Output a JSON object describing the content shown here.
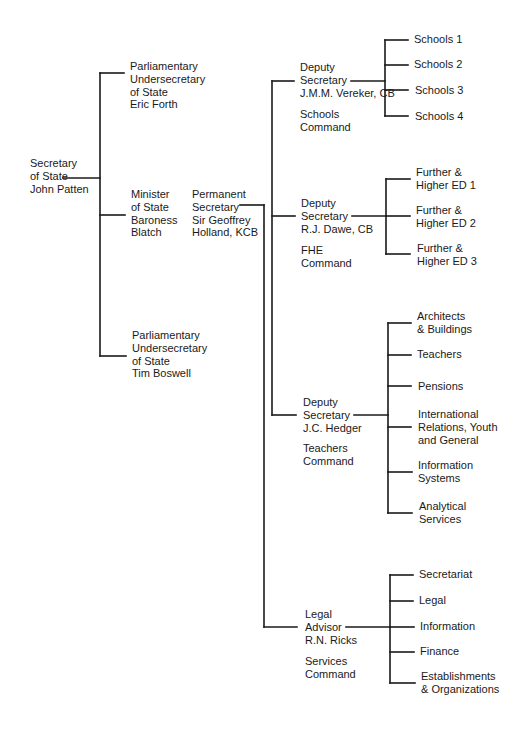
{
  "chart": {
    "type": "org-chart",
    "root": {
      "title_lines": [
        "Secretary",
        "of State",
        "John Patten"
      ]
    },
    "ministers": [
      {
        "title_lines": [
          "Parliamentary",
          "Undersecretary",
          "of State",
          "Eric Forth"
        ]
      },
      {
        "title_lines": [
          "Minister",
          "of State",
          "Baroness",
          "Blatch"
        ]
      },
      {
        "title_lines": [
          "Parliamentary",
          "Undersecretary",
          "of State",
          "Tim Boswell"
        ]
      }
    ],
    "permanent_secretary": {
      "title_lines": [
        "Permanent",
        "Secretary",
        "Sir Geoffrey",
        "Holland, KCB"
      ]
    },
    "commands": [
      {
        "title_lines": [
          "Deputy",
          "Secretary",
          "J.M.M. Vereker, CB"
        ],
        "command_lines": [
          "Schools",
          "Command"
        ],
        "branches": [
          {
            "lines": [
              "Schools 1"
            ]
          },
          {
            "lines": [
              "Schools 2"
            ]
          },
          {
            "lines": [
              "Schools 3"
            ]
          },
          {
            "lines": [
              "Schools 4"
            ]
          }
        ]
      },
      {
        "title_lines": [
          "Deputy",
          "Secretary",
          "R.J. Dawe, CB"
        ],
        "command_lines": [
          "FHE",
          "Command"
        ],
        "branches": [
          {
            "lines": [
              "Further &",
              "Higher ED 1"
            ]
          },
          {
            "lines": [
              "Further &",
              "Higher ED 2"
            ]
          },
          {
            "lines": [
              "Further &",
              "Higher ED 3"
            ]
          }
        ]
      },
      {
        "title_lines": [
          "Deputy",
          "Secretary",
          "J.C. Hedger"
        ],
        "command_lines": [
          "Teachers",
          "Command"
        ],
        "branches": [
          {
            "lines": [
              "Architects",
              "& Buildings"
            ]
          },
          {
            "lines": [
              "Teachers"
            ]
          },
          {
            "lines": [
              "Pensions"
            ]
          },
          {
            "lines": [
              "International",
              "Relations, Youth",
              "and General"
            ]
          },
          {
            "lines": [
              "Information",
              "Systems"
            ]
          },
          {
            "lines": [
              "Analytical",
              "Services"
            ]
          }
        ]
      },
      {
        "title_lines": [
          "Legal",
          "Advisor",
          "R.N. Ricks"
        ],
        "command_lines": [
          "Services",
          "Command"
        ],
        "branches": [
          {
            "lines": [
              "Secretariat"
            ]
          },
          {
            "lines": [
              "Legal"
            ]
          },
          {
            "lines": [
              "Information"
            ]
          },
          {
            "lines": [
              "Finance"
            ]
          },
          {
            "lines": [
              "Establishments",
              "& Organizations"
            ]
          }
        ]
      }
    ],
    "colors": {
      "line": "#1a1a1a",
      "text": "#1a1a1a",
      "background": "#ffffff"
    }
  }
}
